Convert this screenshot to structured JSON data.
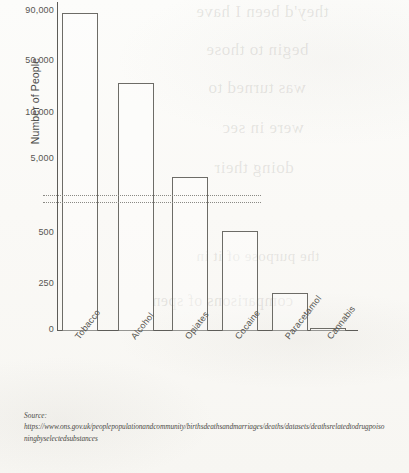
{
  "chart_data": {
    "type": "bar",
    "title": "",
    "subtitle": "",
    "xlabel": "",
    "ylabel": "Number of People",
    "categories": [
      "Tobacco",
      "Alcohol",
      "Opiates",
      "Cocaine",
      "Paracetamol",
      "Cannabis"
    ],
    "values": [
      89000,
      28000,
      4300,
      500,
      200,
      30
    ],
    "series": [
      {
        "name": "Number of People",
        "values": [
          89000,
          28000,
          4300,
          500,
          200,
          30
        ]
      }
    ],
    "y_tick_labels": [
      "90,000",
      "50,000",
      "10,000",
      "5,000",
      "500",
      "250",
      "0"
    ],
    "y_tick_values": [
      90000,
      50000,
      10000,
      5000,
      500,
      250,
      0
    ],
    "broken_axis": true,
    "axis_break_between": [
      500,
      5000
    ],
    "ylim": [
      0,
      90000
    ],
    "grid": false,
    "legend": "none",
    "bar_style": "outline",
    "bar_fill_color": "#ffffff",
    "bar_edge_color": "#6d6c67",
    "axis_color": "#5d5c58",
    "text_color": "#55544f"
  },
  "axis": {
    "y_title": "Number of People",
    "ticks": [
      {
        "label": "90,000",
        "top": 5
      },
      {
        "label": "50,000",
        "top": 55
      },
      {
        "label": "10,000",
        "top": 107
      },
      {
        "label": "5,000",
        "top": 153
      },
      {
        "label": "500",
        "top": 227
      },
      {
        "label": "250",
        "top": 278
      },
      {
        "label": "0",
        "top": 324
      }
    ]
  },
  "bars": [
    {
      "name": "Tobacco",
      "left": 5,
      "width": 36,
      "top": 11,
      "value": 89000
    },
    {
      "name": "Alcohol",
      "left": 61,
      "width": 36,
      "top": 81,
      "value": 28000
    },
    {
      "name": "Opiates",
      "left": 115,
      "width": 36,
      "top": 175,
      "value": 4300
    },
    {
      "name": "Cocaine",
      "left": 165,
      "width": 36,
      "top": 229,
      "value": 500
    },
    {
      "name": "Paracetamol",
      "left": 215,
      "width": 36,
      "top": 291,
      "value": 200
    },
    {
      "name": "Cannabis",
      "left": 253,
      "width": 36,
      "top": 326,
      "value": 30
    }
  ],
  "x_labels": [
    {
      "label": "Tobacco",
      "left": 16
    },
    {
      "label": "Alcohol",
      "left": 72
    },
    {
      "label": "Opiates",
      "left": 126
    },
    {
      "label": "Cocaine",
      "left": 176
    },
    {
      "label": "Paracetamol",
      "left": 226
    },
    {
      "label": "Cannabis",
      "left": 268
    }
  ],
  "break_lines": [
    {
      "top": 193
    },
    {
      "top": 200
    }
  ],
  "source": {
    "label": "Source:",
    "url": "https://www.ons.gov.uk/peoplepopulationandcommunity/birthsdeathsandmarriages/deaths/datasets/deathsrelatedtodrugpoisoningbyselectedsubstances"
  },
  "ghost_text": [
    {
      "text": "they'd been I have",
      "left": 196,
      "top": 2,
      "size": 17
    },
    {
      "text": "begin to those",
      "left": 206,
      "top": 40,
      "size": 17
    },
    {
      "text": "was turned to",
      "left": 208,
      "top": 78,
      "size": 17
    },
    {
      "text": "were in sec",
      "left": 222,
      "top": 118,
      "size": 17
    },
    {
      "text": "doing their",
      "left": 214,
      "top": 158,
      "size": 17
    },
    {
      "text": "the purpose of it in",
      "left": 196,
      "top": 248,
      "size": 15
    },
    {
      "text": "comparisons of spen",
      "left": 152,
      "top": 292,
      "size": 16
    }
  ]
}
